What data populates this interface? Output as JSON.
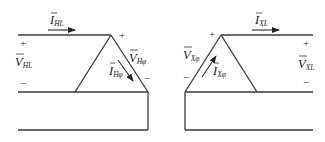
{
  "figure": {
    "type": "delta-delta transformer connection diagram",
    "left": {
      "line_current": {
        "symbol": "I",
        "subscript": "HL"
      },
      "line_voltage": {
        "symbol": "V",
        "subscript": "HL",
        "plus": "+",
        "minus": "−"
      },
      "phase_voltage": {
        "symbol": "V",
        "subscript": "Hφ",
        "plus": "+",
        "minus": "−"
      },
      "phase_current": {
        "symbol": "I",
        "subscript": "Hφ"
      }
    },
    "right": {
      "line_current": {
        "symbol": "I",
        "subscript": "XL"
      },
      "line_voltage": {
        "symbol": "V",
        "subscript": "XL",
        "plus": "+",
        "minus": "−"
      },
      "phase_voltage": {
        "symbol": "V",
        "subscript": "Xφ",
        "plus": "+",
        "minus": "−"
      },
      "phase_current": {
        "symbol": "I",
        "subscript": "Xφ"
      }
    }
  },
  "colors": {
    "wire": "#3a3a3a",
    "text": "#222222"
  }
}
